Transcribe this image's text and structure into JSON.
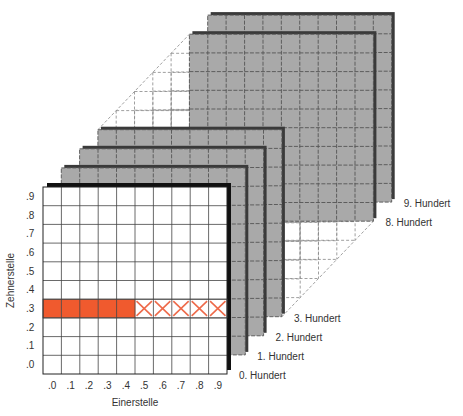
{
  "caption_cut": "Zehner- und Einerstelle als Koordinaten einer Hunderter-Seite",
  "axes": {
    "y_label": "Zehnerstelle",
    "x_label": "Einerstelle",
    "y_ticks": [
      ".9",
      ".8",
      ".7",
      ".6",
      ".5",
      ".4",
      ".3",
      ".2",
      ".1",
      ".0"
    ],
    "x_ticks": [
      ".0",
      ".1",
      ".2",
      ".3",
      ".4",
      ".5",
      ".6",
      ".7",
      ".8",
      ".9"
    ]
  },
  "layers": [
    {
      "label": "0. Hundert",
      "index": 0
    },
    {
      "label": "1. Hundert",
      "index": 1
    },
    {
      "label": "2. Hundert",
      "index": 2
    },
    {
      "label": "3. Hundert",
      "index": 3
    },
    {
      "label": "8. Hundert",
      "index": 8
    },
    {
      "label": "9. Hundert",
      "index": 9
    }
  ],
  "highlight": {
    "row": ".3",
    "filled_columns": [
      ".0",
      ".1",
      ".2",
      ".3",
      ".4"
    ],
    "crossed_columns": [
      ".5",
      ".6",
      ".7",
      ".8",
      ".9"
    ],
    "fill_color": "#F05A2E",
    "cross_color": "#EE6A4A"
  },
  "colors": {
    "panel_back": "#A9A9A9",
    "panel_edge": "#3A3A3A",
    "front_edge": "#111111",
    "grid_line": "#555555",
    "ghost_line": "#888888"
  }
}
